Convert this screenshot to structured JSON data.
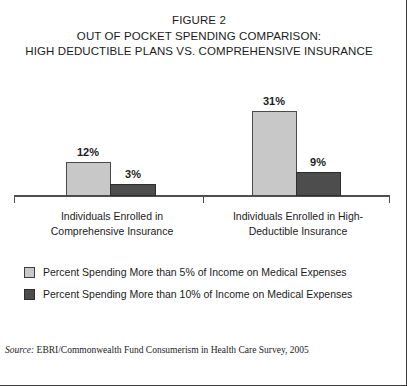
{
  "figure": {
    "title_lines": [
      "FIGURE 2",
      "OUT OF POCKET SPENDING COMPARISON:",
      "HIGH DEDUCTIBLE PLANS VS. COMPREHENSIVE INSURANCE"
    ],
    "source_label": "Source:",
    "source_text": " EBRI/Commonwealth Fund Consumerism in Health Care Survey, 2005"
  },
  "legend": {
    "items": [
      {
        "label": "Percent Spending More than 5% of Income on Medical Expenses",
        "color": "#c8c8c8",
        "swatch": "light"
      },
      {
        "label": "Percent Spending More than 10% of Income on Medical Expenses",
        "color": "#4d4d4d",
        "swatch": "dark"
      }
    ]
  },
  "categories": [
    {
      "line1": "Individuals Enrolled in",
      "line2": "Comprehensive Insurance"
    },
    {
      "line1": "Individuals Enrolled in High-",
      "line2": "Deductible Insurance"
    }
  ],
  "bars": {
    "comprehensive_5pct": "12%",
    "comprehensive_10pct": "3%",
    "highdeductible_5pct": "31%",
    "highdeductible_10pct": "9%"
  },
  "chart_data": {
    "type": "bar",
    "xlabel": "",
    "ylabel": "",
    "ylim": [
      0,
      35
    ],
    "grid": false,
    "legend_position": "bottom-left",
    "categories": [
      "Individuals Enrolled in Comprehensive Insurance",
      "Individuals Enrolled in High-Deductible Insurance"
    ],
    "series": [
      {
        "name": "Percent Spending More than 5% of Income on Medical Expenses",
        "color": "#c8c8c8",
        "values": [
          12,
          3.0
        ],
        "value_labels": [
          "12%",
          null
        ]
      },
      {
        "name": "Percent Spending More than 10% of Income on Medical Expenses",
        "color": "#4d4d4d",
        "values": [
          3,
          9
        ],
        "value_labels": [
          "3%",
          "9%"
        ]
      }
    ],
    "data_points": [
      {
        "category": "Individuals Enrolled in Comprehensive Insurance",
        "series": "Percent Spending More than 5% of Income on Medical Expenses",
        "value": 12,
        "label": "12%"
      },
      {
        "category": "Individuals Enrolled in Comprehensive Insurance",
        "series": "Percent Spending More than 10% of Income on Medical Expenses",
        "value": 3,
        "label": "3%"
      },
      {
        "category": "Individuals Enrolled in High-Deductible Insurance",
        "series": "Percent Spending More than 5% of Income on Medical Expenses",
        "value": 31,
        "label": "31%"
      },
      {
        "category": "Individuals Enrolled in High-Deductible Insurance",
        "series": "Percent Spending More than 10% of Income on Medical Expenses",
        "value": 9,
        "label": "9%"
      }
    ],
    "source": "Source: EBRI/Commonwealth Fund Consumerism in Health Care Survey, 2005",
    "units": "percent"
  }
}
